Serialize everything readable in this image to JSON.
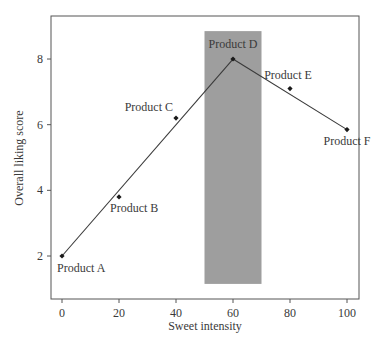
{
  "chart_data": {
    "type": "line",
    "title": "",
    "xlabel": "Sweet intensity",
    "ylabel": "Overall liking score",
    "xlim": [
      -3,
      104
    ],
    "ylim": [
      0.7,
      9.2
    ],
    "xticks": [
      0,
      20,
      40,
      60,
      80,
      100
    ],
    "yticks": [
      2,
      4,
      6,
      8
    ],
    "grid": false,
    "legend": null,
    "series": [
      {
        "name": "Products",
        "x": [
          0,
          20,
          40,
          60,
          80,
          100
        ],
        "y": [
          2.0,
          3.8,
          6.2,
          8.0,
          7.1,
          5.85
        ],
        "labels": [
          "Product A",
          "Product B",
          "Product C",
          "Product D",
          "Product E",
          "Product F"
        ]
      }
    ],
    "fitted_lines": [
      {
        "from": [
          0,
          2.0
        ],
        "to": [
          60,
          8.0
        ]
      },
      {
        "from": [
          60,
          8.0
        ],
        "to": [
          100,
          5.85
        ]
      }
    ],
    "annotations": [
      {
        "type": "shaded_region",
        "x_range": [
          50,
          70
        ],
        "y_range": [
          1.15,
          8.85
        ],
        "color": "#9e9e9e"
      }
    ],
    "colors": {
      "line": "#3a3a3a",
      "marker": "#1a1a1a",
      "frame": "#555555",
      "shade": "#9e9e9e"
    }
  }
}
